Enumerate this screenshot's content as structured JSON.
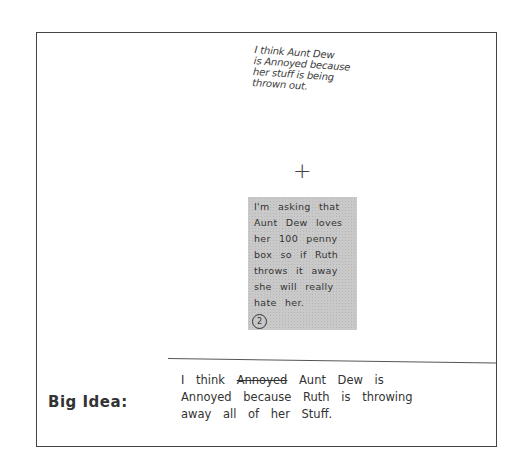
{
  "top_note": {
    "lines": [
      "I think Aunt Dew",
      "is Annoyed because",
      "her stuff is being",
      "thrown out."
    ]
  },
  "connector_symbol": "+",
  "evidence_box": {
    "lines": [
      "I'm asking that",
      "Aunt Dew loves",
      "her 100 penny",
      "box so if Ruth",
      "throws it away",
      "she will really",
      "hate her."
    ],
    "number_label": "2"
  },
  "big_idea": {
    "label": "Big Idea:",
    "answer": {
      "line1_prefix": "I think",
      "line1_struck": "Annoyed",
      "line1_suffix": "Aunt Dew is",
      "line2": "Annoyed because Ruth is throwing",
      "line3": "away all of her Stuff."
    }
  }
}
